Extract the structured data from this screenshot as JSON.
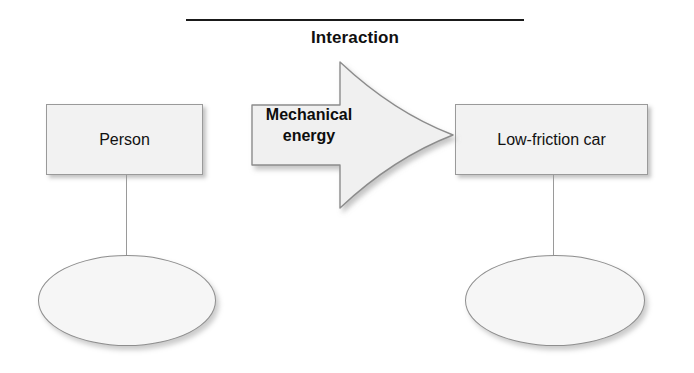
{
  "diagram": {
    "title": "Interaction",
    "objects": [
      {
        "id": "person",
        "label": "Person"
      },
      {
        "id": "low-friction-car",
        "label": "Low-friction car"
      }
    ],
    "transfer_arrow": {
      "label_line1": "Mechanical",
      "label_line2": "energy",
      "direction": "left-to-right"
    },
    "energy_pies": [
      {
        "id": "person-energy-pie",
        "label": ""
      },
      {
        "id": "car-energy-pie",
        "label": ""
      }
    ],
    "colors": {
      "box_fill": "#f2f2f2",
      "box_border": "#9a9a9a",
      "ellipse_fill": "#f6f6f6",
      "ellipse_border": "#8e8e8e",
      "arrow_fill": "#f0f0f0",
      "arrow_border": "#8c8c8c",
      "rule": "#1a1a1a",
      "text": "#111111"
    }
  }
}
